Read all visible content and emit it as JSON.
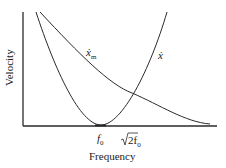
{
  "diagram": {
    "axes": {
      "x_label": "Frequency",
      "y_label": "Velocity"
    },
    "curves": [
      {
        "name": "x_m",
        "label_main": "ẋ",
        "label_sub": "m",
        "shape": "decreasing curve"
      },
      {
        "name": "x",
        "label_main": "ẋ",
        "label_sub": "",
        "shape": "U-shaped curve with minimum at f0"
      }
    ],
    "ticks": {
      "f0_main": "f",
      "f0_sub": "0",
      "sqrt2f0_radical": "√",
      "sqrt2f0_main": "2f",
      "sqrt2f0_sub": "0"
    },
    "colors": {
      "line": "#2a2a2a",
      "background": "#ffffff"
    }
  }
}
